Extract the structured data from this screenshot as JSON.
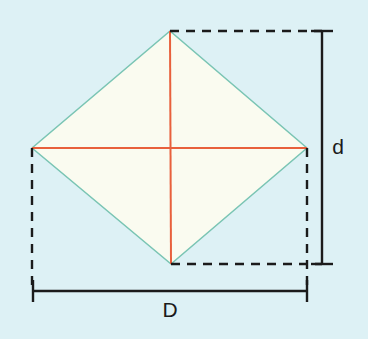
{
  "figure": {
    "canvas": {
      "width": 368,
      "height": 339,
      "background": "#ddf1f5"
    },
    "shape": {
      "name": "rhombus",
      "fill": "#fafbf0",
      "stroke": "#7ac5b4",
      "stroke_width": 1.6,
      "vertices": {
        "top": {
          "x": 170,
          "y": 31
        },
        "right": {
          "x": 307,
          "y": 148
        },
        "bottom": {
          "x": 171,
          "y": 264
        },
        "left": {
          "x": 32,
          "y": 148
        }
      }
    },
    "diagonals": {
      "color": "#e8603c",
      "stroke_width": 2,
      "horizontal": {
        "x1": 32,
        "y1": 148,
        "x2": 307,
        "y2": 148
      },
      "vertical": {
        "x1": 170,
        "y1": 31,
        "x2": 171,
        "y2": 264
      }
    },
    "construction_lines": {
      "color": "#1b1b1b",
      "dash": "9 7",
      "stroke_width": 2.4,
      "top_edge": {
        "x1": 170,
        "y1": 31,
        "x2": 322,
        "y2": 31
      },
      "bottom_edge": {
        "x1": 171,
        "y1": 264,
        "x2": 322,
        "y2": 264
      },
      "left_edge": {
        "x1": 32,
        "y1": 148,
        "x2": 32,
        "y2": 291
      },
      "right_edge": {
        "x1": 307,
        "y1": 148,
        "x2": 307,
        "y2": 291
      }
    },
    "dimensions": [
      {
        "id": "minor-diagonal",
        "label": "d",
        "orientation": "vertical",
        "axis": 322,
        "from": 31,
        "to": 264,
        "cap_half_length": 11,
        "color": "#1b1b1b",
        "label_x": 338,
        "label_y": 154
      },
      {
        "id": "major-diagonal",
        "label": "D",
        "orientation": "horizontal",
        "axis": 291,
        "from": 33,
        "to": 307,
        "cap_half_length": 11,
        "color": "#1b1b1b",
        "label_x": 170,
        "label_y": 317
      }
    ]
  }
}
